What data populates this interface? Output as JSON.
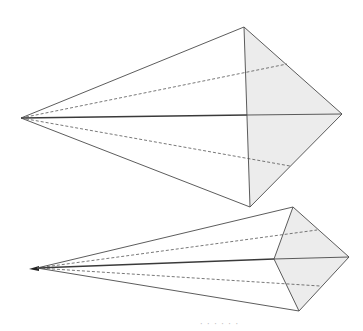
{
  "diagram": {
    "type": "geometric-figures",
    "colors": {
      "face_fill": "#ececec",
      "edge": "#4a4a4a",
      "hidden_edge": "#555555"
    },
    "figures": [
      {
        "id": "upper-pyramid",
        "apex": [
          21,
          118
        ],
        "base_top": [
          244,
          27
        ],
        "base_center": [
          247,
          115
        ],
        "base_right": [
          342,
          114
        ],
        "base_bottom": [
          250,
          207
        ],
        "hidden_upper_end": [
          287,
          64
        ],
        "hidden_lower_end": [
          290,
          166
        ]
      },
      {
        "id": "lower-pyramid",
        "apex": [
          37,
          268
        ],
        "apex_tip": [
          29,
          269
        ],
        "base_top": [
          293,
          207
        ],
        "base_center": [
          274,
          259
        ],
        "base_right": [
          349,
          257
        ],
        "base_bottom": [
          299,
          311
        ],
        "hidden_upper_end": [
          317,
          230
        ],
        "hidden_lower_end": [
          320,
          286
        ]
      }
    ],
    "caption": "· · · ·  · ·"
  }
}
